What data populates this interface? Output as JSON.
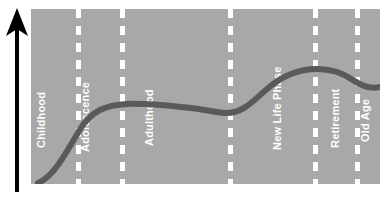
{
  "figure": {
    "kind": "life-course-timeline",
    "background_color": "#ffffff",
    "panel_color": "#a8a8a8",
    "divider_color": "#ffffff",
    "label_color": "#ffffff",
    "curve_color": "#5a5a5a",
    "axis_color": "#000000",
    "y_axis_icon": "up-arrow-icon"
  },
  "chart_data": {
    "type": "line",
    "title": "",
    "xlabel": "",
    "ylabel": "",
    "grid": false,
    "legend": "none",
    "categories": [
      "Childhood",
      "Adolescence",
      "Adulthood",
      "New Life Phase",
      "Retirement",
      "Old Age"
    ],
    "series": [
      {
        "name": "life course trajectory",
        "x": [
          2,
          10,
          20,
          30,
          40,
          50,
          57,
          64,
          72,
          80,
          86,
          92,
          100
        ],
        "values": [
          2,
          14,
          30,
          43,
          50,
          52,
          51,
          49,
          52,
          62,
          70,
          73,
          68
        ]
      }
    ],
    "xlim": [
      0,
      100
    ],
    "ylim": [
      0,
      100
    ],
    "annotations": [
      {
        "label": "Childhood",
        "x_start": 0,
        "x_end": 13
      },
      {
        "label": "Adolescence",
        "x_start": 13,
        "x_end": 26
      },
      {
        "label": "Adulthood",
        "x_start": 26,
        "x_end": 57
      },
      {
        "label": "New Life Phase",
        "x_start": 57,
        "x_end": 81
      },
      {
        "label": "Retirement",
        "x_start": 81,
        "x_end": 93
      },
      {
        "label": "Old Age",
        "x_start": 93,
        "x_end": 100
      }
    ]
  },
  "panel": {
    "dividers": [
      {
        "name": "divider-childhood-adolescence",
        "x": 45
      },
      {
        "name": "divider-adolescence-adulthood",
        "x": 89
      },
      {
        "name": "divider-adulthood-newlifephase",
        "x": 197
      },
      {
        "name": "divider-newlifephase-retirement",
        "x": 282
      },
      {
        "name": "divider-retirement-oldage",
        "x": 324
      }
    ],
    "labels": [
      {
        "name": "phase-label-childhood",
        "text": "Childhood",
        "x": 16,
        "bottom": 128
      },
      {
        "name": "phase-label-adolescence",
        "text": "Adolescence",
        "x": 60,
        "bottom": 132
      },
      {
        "name": "phase-label-adulthood",
        "text": "Adulthood",
        "x": 124,
        "bottom": 126
      },
      {
        "name": "phase-label-newlifephase",
        "text": "New Life Phase",
        "x": 252,
        "bottom": 130
      },
      {
        "name": "phase-label-retirement",
        "text": "Retirement",
        "x": 310,
        "bottom": 128
      },
      {
        "name": "phase-label-oldage",
        "text": "Old Age",
        "x": 340,
        "bottom": 122
      }
    ]
  },
  "curve": {
    "path": "M 7,174 C 22,168 34,146 48,122 C 60,101 76,96 96,95 C 118,94 140,97 160,99 C 178,101 186,104 196,104 C 212,104 222,92 236,80 C 252,66 268,60 286,60 C 300,60 312,64 322,71 C 332,78 340,80 349,78",
    "stroke_width": 6
  }
}
